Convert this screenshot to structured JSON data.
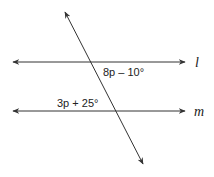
{
  "diagram": {
    "type": "parallel-lines-transversal",
    "lines": {
      "l": {
        "label": "l"
      },
      "m": {
        "label": "m"
      }
    },
    "angles": {
      "upper": {
        "label": "8p – 10°"
      },
      "lower": {
        "label": "3p + 25°"
      }
    },
    "colors": {
      "stroke": "#333333",
      "background": "#ffffff"
    }
  }
}
